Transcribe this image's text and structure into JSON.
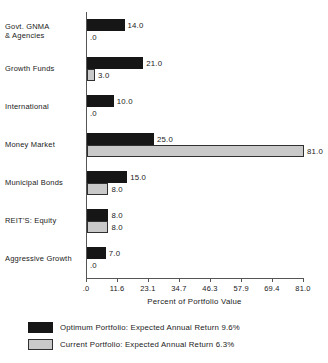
{
  "chart_data": {
    "type": "bar",
    "orientation": "horizontal",
    "title": "",
    "xlabel": "Percent of Portfolio Value",
    "ylabel": "",
    "xlim": [
      0,
      81.0
    ],
    "grid": false,
    "legend_position": "bottom-left",
    "categories": [
      "Govt. GNMA\n& Agencies",
      "Growth Funds",
      "International",
      "Money Market",
      "Municipal Bonds",
      "REIT'S:  Equity",
      "Aggressive Growth"
    ],
    "tick_labels": [
      ".0",
      "11.6",
      "23.1",
      "34.7",
      "46.3",
      "57.9",
      "69.4",
      "81.0"
    ],
    "tick_values": [
      0,
      11.6,
      23.1,
      34.7,
      46.3,
      57.9,
      69.4,
      81.0
    ],
    "series": [
      {
        "name": "Optimum Portfolio:  Expected Annual Return 9.6%",
        "short_name": "Optimum Portfolio",
        "color": "#161616",
        "values": [
          14.0,
          21.0,
          10.0,
          25.0,
          15.0,
          8.0,
          7.0
        ],
        "labels": [
          "14.0",
          "21.0",
          "10.0",
          "25.0",
          "15.0",
          "8.0",
          "7.0"
        ]
      },
      {
        "name": "Current Portfolio:  Expected Annual Return 6.3%",
        "short_name": "Current Portfolio",
        "color": "#c9c9c9",
        "values": [
          0.0,
          3.0,
          0.0,
          81.0,
          8.0,
          8.0,
          0.0
        ],
        "labels": [
          ".0",
          "3.0",
          ".0",
          "81.0",
          "8.0",
          "8.0",
          ".0"
        ]
      }
    ]
  },
  "legend": {
    "items": [
      {
        "label": "Optimum Portfolio:  Expected Annual Return 9.6%",
        "swatch": "optimum"
      },
      {
        "label": "Current Portfolio:  Expected Annual Return 6.3%",
        "swatch": "current"
      }
    ]
  }
}
